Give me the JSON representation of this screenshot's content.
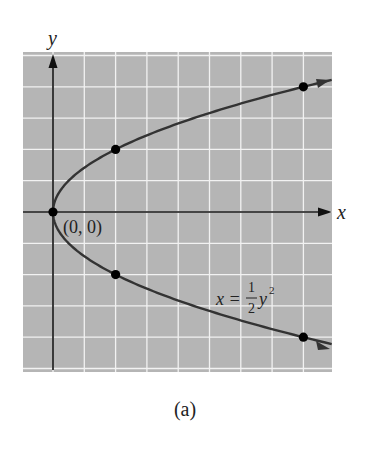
{
  "figure": {
    "caption": "(a)",
    "grid_color": "#b5b5b5",
    "grid_line_color": "#f2f2f2",
    "curve_color": "#333333"
  },
  "chart_data": {
    "type": "line",
    "title": "",
    "xlabel": "x",
    "ylabel": "y",
    "xlim": [
      -1,
      8.9
    ],
    "ylim": [
      -5.1,
      5.1
    ],
    "grid": true,
    "legend": null,
    "series": [
      {
        "name": "x = 1/2 y^2",
        "equation": "x = (1/2)y^2",
        "curve": "parabola opening right",
        "points": [
          {
            "x": 0,
            "y": 0,
            "label": "(0, 0)"
          },
          {
            "x": 2,
            "y": 2
          },
          {
            "x": 8,
            "y": 4
          },
          {
            "x": 2,
            "y": -2
          },
          {
            "x": 8,
            "y": -4
          }
        ]
      }
    ],
    "annotations": [
      {
        "text": "(0, 0)",
        "at": [
          0,
          0
        ]
      },
      {
        "text": "x = 1/2 y^2",
        "at": [
          5.6,
          -2.9
        ]
      }
    ]
  },
  "labels": {
    "x_axis": "x",
    "y_axis": "y",
    "origin": "(0, 0)",
    "eq_lhs": "x =",
    "eq_num": "1",
    "eq_den": "2",
    "eq_var": "y",
    "eq_exp": "2"
  }
}
